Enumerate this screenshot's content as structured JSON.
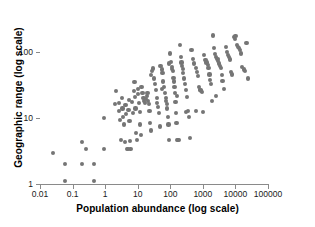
{
  "chart_data": {
    "type": "scatter",
    "title": "",
    "xlabel": "Population abundance (log scale)",
    "ylabel": "Geographic range (log scale)",
    "xscale": "log",
    "yscale": "log",
    "xlim": [
      0.01,
      100000
    ],
    "ylim": [
      1,
      370
    ],
    "grid": false,
    "legend": null,
    "marker": {
      "shape": "circle",
      "color": "#757575",
      "size_px": 4.2
    },
    "xticks": [
      0.01,
      0.1,
      1,
      10,
      100,
      1000,
      10000,
      100000
    ],
    "xtick_labels": [
      "0.01",
      "0.1",
      "1",
      "10",
      "100",
      "1000",
      "10000",
      "100000"
    ],
    "yticks": [
      1,
      10,
      100
    ],
    "ytick_labels": [
      "1",
      "10",
      "100"
    ],
    "n_points": 163,
    "points": [
      [
        0.025,
        3.0
      ],
      [
        0.06,
        2.0
      ],
      [
        0.06,
        1.1
      ],
      [
        0.2,
        4.3
      ],
      [
        0.26,
        3.4
      ],
      [
        0.2,
        2.0
      ],
      [
        0.45,
        2.0
      ],
      [
        0.45,
        1.1
      ],
      [
        0.9,
        10.0
      ],
      [
        0.9,
        3.4
      ],
      [
        2.0,
        16.5
      ],
      [
        2.2,
        26.0
      ],
      [
        2.6,
        13.0
      ],
      [
        2.6,
        17.0
      ],
      [
        2.8,
        9.5
      ],
      [
        3.0,
        4.6
      ],
      [
        3.2,
        20.0
      ],
      [
        3.4,
        14.0
      ],
      [
        3.6,
        10.5
      ],
      [
        3.8,
        8.0
      ],
      [
        4.0,
        4.4
      ],
      [
        4.2,
        16.0
      ],
      [
        4.4,
        11.5
      ],
      [
        4.6,
        3.4
      ],
      [
        5.0,
        3.4
      ],
      [
        5.2,
        13.5
      ],
      [
        5.4,
        19.0
      ],
      [
        5.6,
        9.0
      ],
      [
        5.8,
        4.5
      ],
      [
        6.0,
        3.4
      ],
      [
        6.5,
        17.5
      ],
      [
        7.0,
        12.0
      ],
      [
        7.5,
        26.0
      ],
      [
        8.0,
        35.0
      ],
      [
        8.2,
        21.0
      ],
      [
        8.6,
        14.0
      ],
      [
        9.0,
        6.0
      ],
      [
        9.5,
        4.6
      ],
      [
        10.0,
        28.0
      ],
      [
        10.5,
        23.0
      ],
      [
        11.0,
        17.0
      ],
      [
        11.5,
        12.5
      ],
      [
        12.0,
        8.0
      ],
      [
        12.5,
        5.5
      ],
      [
        13.0,
        30.0
      ],
      [
        14.0,
        24.0
      ],
      [
        15.0,
        20.0
      ],
      [
        16.0,
        18.5
      ],
      [
        17.0,
        17.0
      ],
      [
        18.0,
        19.5
      ],
      [
        19.0,
        22.0
      ],
      [
        20.0,
        24.0
      ],
      [
        21.0,
        18.0
      ],
      [
        22.0,
        16.5
      ],
      [
        23.0,
        13.0
      ],
      [
        24.0,
        8.5
      ],
      [
        25.0,
        6.5
      ],
      [
        26.0,
        45.0
      ],
      [
        28.0,
        52.0
      ],
      [
        30.0,
        57.0
      ],
      [
        32.0,
        40.0
      ],
      [
        34.0,
        33.0
      ],
      [
        36.0,
        27.0
      ],
      [
        38.0,
        20.0
      ],
      [
        40.0,
        17.0
      ],
      [
        42.0,
        15.0
      ],
      [
        45.0,
        12.0
      ],
      [
        48.0,
        7.5
      ],
      [
        50.0,
        62.0
      ],
      [
        55.0,
        55.0
      ],
      [
        58.0,
        48.0
      ],
      [
        60.0,
        36.0
      ],
      [
        65.0,
        30.0
      ],
      [
        70.0,
        24.0
      ],
      [
        72.0,
        20.0
      ],
      [
        75.0,
        18.0
      ],
      [
        78.0,
        16.5
      ],
      [
        80.0,
        14.0
      ],
      [
        85.0,
        10.5
      ],
      [
        88.0,
        8.0
      ],
      [
        92.0,
        4.6
      ],
      [
        100.0,
        96.0
      ],
      [
        105.0,
        72.0
      ],
      [
        110.0,
        60.0
      ],
      [
        115.0,
        56.0
      ],
      [
        120.0,
        52.0
      ],
      [
        125.0,
        41.0
      ],
      [
        130.0,
        36.0
      ],
      [
        135.0,
        30.0
      ],
      [
        140.0,
        24.0
      ],
      [
        145.0,
        17.5
      ],
      [
        150.0,
        12.0
      ],
      [
        155.0,
        8.5
      ],
      [
        160.0,
        4.6
      ],
      [
        170.0,
        4.6
      ],
      [
        180.0,
        4.6
      ],
      [
        200.0,
        130.0
      ],
      [
        210.0,
        86.0
      ],
      [
        220.0,
        70.0
      ],
      [
        230.0,
        62.0
      ],
      [
        240.0,
        56.0
      ],
      [
        250.0,
        48.0
      ],
      [
        260.0,
        40.0
      ],
      [
        280.0,
        33.0
      ],
      [
        300.0,
        27.0
      ],
      [
        320.0,
        21.0
      ],
      [
        350.0,
        13.0
      ],
      [
        380.0,
        10.5
      ],
      [
        400.0,
        5.0
      ],
      [
        450.0,
        110.0
      ],
      [
        500.0,
        80.0
      ],
      [
        550.0,
        68.0
      ],
      [
        600.0,
        58.0
      ],
      [
        650.0,
        50.0
      ],
      [
        700.0,
        44.0
      ],
      [
        750.0,
        30.0
      ],
      [
        800.0,
        27.0
      ],
      [
        850.0,
        26.5
      ],
      [
        900.0,
        26.0
      ],
      [
        950.0,
        25.0
      ],
      [
        1000.0,
        12.5
      ],
      [
        1100.0,
        90.0
      ],
      [
        1200.0,
        76.0
      ],
      [
        1300.0,
        70.0
      ],
      [
        1400.0,
        64.0
      ],
      [
        1500.0,
        58.0
      ],
      [
        1600.0,
        46.0
      ],
      [
        1700.0,
        38.0
      ],
      [
        1800.0,
        33.0
      ],
      [
        1900.0,
        18.0
      ],
      [
        2000.0,
        180.0
      ],
      [
        2200.0,
        115.0
      ],
      [
        2400.0,
        95.0
      ],
      [
        2600.0,
        86.0
      ],
      [
        2800.0,
        80.0
      ],
      [
        3000.0,
        74.0
      ],
      [
        3200.0,
        68.0
      ],
      [
        3400.0,
        63.0
      ],
      [
        3600.0,
        58.0
      ],
      [
        3800.0,
        45.0
      ],
      [
        4000.0,
        37.0
      ],
      [
        4500.0,
        28.0
      ],
      [
        5000.0,
        120.0
      ],
      [
        5500.0,
        100.0
      ],
      [
        6000.0,
        90.0
      ],
      [
        6500.0,
        84.0
      ],
      [
        7000.0,
        78.0
      ],
      [
        7500.0,
        50.0
      ],
      [
        8000.0,
        46.0
      ],
      [
        9000.0,
        170.0
      ],
      [
        9500.0,
        160.0
      ],
      [
        10000.0,
        175.0
      ],
      [
        11000.0,
        128.0
      ],
      [
        12000.0,
        122.0
      ],
      [
        13000.0,
        116.0
      ],
      [
        14000.0,
        110.0
      ],
      [
        15000.0,
        96.0
      ],
      [
        16000.0,
        60.0
      ],
      [
        18000.0,
        55.0
      ],
      [
        20000.0,
        52.0
      ],
      [
        22000.0,
        140.0
      ],
      [
        25000.0,
        40.0
      ],
      [
        2500.0,
        22.0
      ],
      [
        600.0,
        13.0
      ],
      [
        300.0,
        12.5
      ],
      [
        160.0,
        22.0
      ],
      [
        90.0,
        68.0
      ],
      [
        55.0,
        28.0
      ]
    ]
  },
  "axes": {
    "x_title": "Population abundance (log scale)",
    "y_title": "Geographic range (log scale)",
    "x_tick_labels": [
      "0.01",
      "0.1",
      "1",
      "10",
      "100",
      "1000",
      "10000",
      "100000"
    ],
    "y_tick_labels": [
      "1",
      "10",
      "100"
    ]
  },
  "colors": {
    "marker": "#757575",
    "axis": "#8a8a8a",
    "text": "#000000",
    "background": "#ffffff"
  }
}
